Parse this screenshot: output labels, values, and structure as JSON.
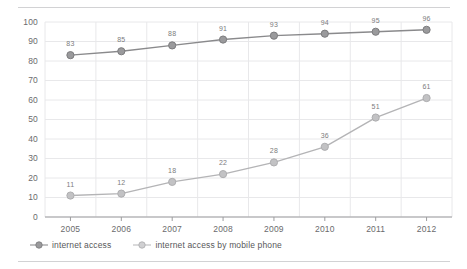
{
  "chart_data": {
    "type": "line",
    "title": "",
    "xlabel": "",
    "ylabel": "",
    "categories": [
      "2005",
      "2006",
      "2007",
      "2008",
      "2009",
      "2010",
      "2011",
      "2012"
    ],
    "ylim": [
      0,
      100
    ],
    "ytick_step": 10,
    "yticks": [
      "0",
      "10",
      "20",
      "30",
      "40",
      "50",
      "60",
      "70",
      "80",
      "90",
      "100"
    ],
    "grid": true,
    "legend_position": "bottom-left",
    "series": [
      {
        "name": "internet access",
        "color": "#8a8a8c",
        "marker_color": "#9a9a9c",
        "values": [
          83,
          85,
          88,
          91,
          93,
          94,
          95,
          96
        ],
        "labels": [
          "83",
          "85",
          "88",
          "91",
          "93",
          "94",
          "95",
          "96"
        ]
      },
      {
        "name": "internet access by mobile phone",
        "color": "#b4b4b6",
        "marker_color": "#c2c2c4",
        "values": [
          11,
          12,
          18,
          22,
          28,
          36,
          51,
          61
        ],
        "labels": [
          "11",
          "12",
          "18",
          "22",
          "28",
          "36",
          "51",
          "61"
        ]
      }
    ]
  },
  "legend": {
    "items": [
      {
        "label": "internet access"
      },
      {
        "label": "internet access by mobile phone"
      }
    ]
  },
  "colors": {
    "grid": "#e8e8ea",
    "axis": "#9d9d9f",
    "frame_rule": "#d2d2d4",
    "text": "#58585a",
    "series_1": "#8a8a8c",
    "series_2": "#b4b4b6"
  }
}
